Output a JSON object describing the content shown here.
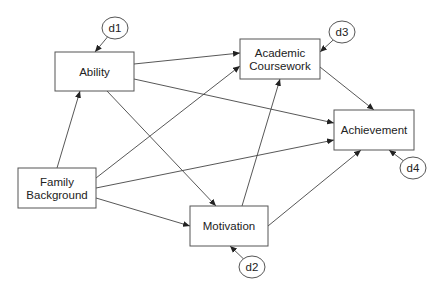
{
  "diagram": {
    "type": "path-diagram",
    "nodes": [
      {
        "id": "ability",
        "lines": [
          "Ability"
        ],
        "x": 55,
        "y": 52,
        "w": 79,
        "h": 39
      },
      {
        "id": "academic_coursework",
        "lines": [
          "Academic",
          "Coursework"
        ],
        "x": 240,
        "y": 39,
        "w": 80,
        "h": 40
      },
      {
        "id": "achievement",
        "lines": [
          "Achievement"
        ],
        "x": 334,
        "y": 110,
        "w": 80,
        "h": 40
      },
      {
        "id": "family_background",
        "lines": [
          "Family",
          "Background"
        ],
        "x": 18,
        "y": 168,
        "w": 78,
        "h": 40
      },
      {
        "id": "motivation",
        "lines": [
          "Motivation"
        ],
        "x": 190,
        "y": 206,
        "w": 78,
        "h": 40
      }
    ],
    "disturbances": [
      {
        "id": "d1",
        "label": "d1",
        "cx": 115,
        "cy": 28,
        "rx": 13,
        "ry": 11,
        "target": "ability",
        "tx": 95,
        "ty": 52
      },
      {
        "id": "d3",
        "label": "d3",
        "cx": 342,
        "cy": 32,
        "rx": 13,
        "ry": 11,
        "target": "academic_coursework",
        "tx": 320,
        "ty": 52
      },
      {
        "id": "d4",
        "label": "d4",
        "cx": 413,
        "cy": 168,
        "rx": 13,
        "ry": 11,
        "target": "achievement",
        "tx": 389,
        "ty": 150
      },
      {
        "id": "d2",
        "label": "d2",
        "cx": 252,
        "cy": 267,
        "rx": 13,
        "ry": 11,
        "target": "motivation",
        "tx": 230,
        "ty": 246
      }
    ],
    "edges": [
      {
        "from": "family_background",
        "to": "ability",
        "x1": 57,
        "y1": 168,
        "x2": 80,
        "y2": 91
      },
      {
        "from": "family_background",
        "to": "academic_coursework",
        "x1": 96,
        "y1": 178,
        "x2": 240,
        "y2": 66
      },
      {
        "from": "family_background",
        "to": "achievement",
        "x1": 96,
        "y1": 188,
        "x2": 334,
        "y2": 140
      },
      {
        "from": "family_background",
        "to": "motivation",
        "x1": 96,
        "y1": 198,
        "x2": 190,
        "y2": 226
      },
      {
        "from": "ability",
        "to": "academic_coursework",
        "x1": 134,
        "y1": 64,
        "x2": 240,
        "y2": 53
      },
      {
        "from": "ability",
        "to": "achievement",
        "x1": 134,
        "y1": 79,
        "x2": 334,
        "y2": 123
      },
      {
        "from": "ability",
        "to": "motivation",
        "x1": 107,
        "y1": 91,
        "x2": 216,
        "y2": 206
      },
      {
        "from": "motivation",
        "to": "academic_coursework",
        "x1": 242,
        "y1": 206,
        "x2": 280,
        "y2": 79
      },
      {
        "from": "motivation",
        "to": "achievement",
        "x1": 268,
        "y1": 226,
        "x2": 361,
        "y2": 150
      },
      {
        "from": "academic_coursework",
        "to": "achievement",
        "x1": 320,
        "y1": 67,
        "x2": 374,
        "y2": 110
      }
    ]
  }
}
